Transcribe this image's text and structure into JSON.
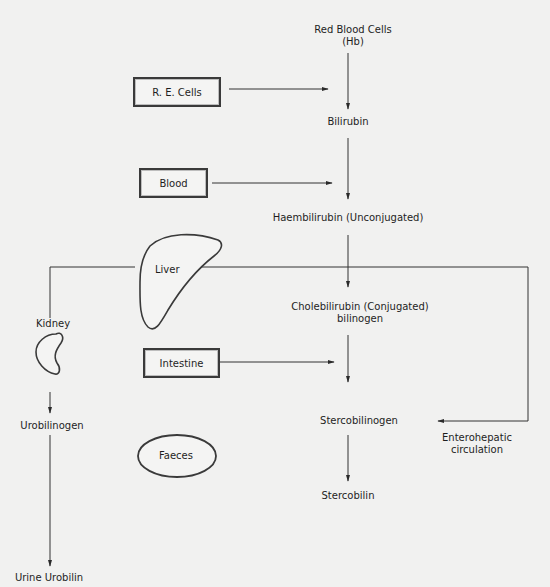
{
  "diagram": {
    "type": "flowchart",
    "topic": "Bilirubin metabolism pathway",
    "main_chain": [
      {
        "id": "rbc",
        "label_line1": "Red Blood Cells",
        "label_line2": "(Hb)"
      },
      {
        "id": "bilirubin",
        "label": "Bilirubin"
      },
      {
        "id": "haembilirubin",
        "label": "Haembilirubin (Unconjugated)"
      },
      {
        "id": "cholebilirubin",
        "label_line1": "Cholebilirubin (Conjugated)",
        "label_line2": "bilinogen"
      },
      {
        "id": "stercobilinogen",
        "label": "Stercobilinogen"
      },
      {
        "id": "stercobilin",
        "label": "Stercobilin"
      }
    ],
    "side_inputs": [
      {
        "id": "re_cells",
        "label": "R. E. Cells",
        "shape": "box",
        "points_to": "between rbc and bilirubin"
      },
      {
        "id": "blood",
        "label": "Blood",
        "shape": "box",
        "points_to": "between bilirubin and haembilirubin"
      },
      {
        "id": "intestine",
        "label": "Intestine",
        "shape": "box",
        "points_to": "between cholebilirubin and stercobilinogen"
      }
    ],
    "organs": {
      "liver": {
        "label": "Liver",
        "shape": "liver-outline"
      },
      "kidney": {
        "label": "Kidney",
        "shape": "kidney-outline"
      },
      "faeces": {
        "label": "Faeces",
        "shape": "ellipse"
      }
    },
    "kidney_branch": [
      {
        "id": "urobilinogen",
        "label": "Urobilinogen"
      },
      {
        "id": "urine_urobilin",
        "label": "Urine Urobilin"
      }
    ],
    "loop": {
      "label_line1": "Enterohepatic",
      "label_line2": "circulation",
      "description": "Loop from Stercobilinogen back up to the level of the liver, connecting across to the kidney branch"
    },
    "edges": [
      {
        "from": "Red Blood Cells (Hb)",
        "to": "Bilirubin"
      },
      {
        "from": "R. E. Cells",
        "to": "Bilirubin"
      },
      {
        "from": "Bilirubin",
        "to": "Haembilirubin (Unconjugated)"
      },
      {
        "from": "Blood",
        "to": "Haembilirubin (Unconjugated)"
      },
      {
        "from": "Haembilirubin (Unconjugated)",
        "to": "Cholebilirubin (Conjugated)"
      },
      {
        "from": "Cholebilirubin (Conjugated)",
        "to": "Stercobilinogen"
      },
      {
        "from": "Intestine",
        "to": "Stercobilinogen"
      },
      {
        "from": "Enterohepatic circulation loop",
        "to": "Stercobilinogen"
      },
      {
        "from": "Stercobilinogen",
        "to": "Stercobilin"
      },
      {
        "from": "Kidney",
        "to": "Urobilinogen"
      },
      {
        "from": "Urobilinogen",
        "to": "Urine Urobilin"
      }
    ]
  }
}
